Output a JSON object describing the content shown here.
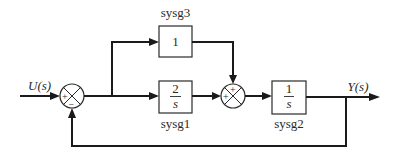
{
  "diagram": {
    "type": "block-diagram",
    "input": {
      "label": "U(s)"
    },
    "output": {
      "label": "Y(s)"
    },
    "summing_junctions": [
      {
        "id": "sum1",
        "signs": {
          "left": "+",
          "bottom": "−"
        }
      },
      {
        "id": "sum2",
        "signs": {
          "left": "+",
          "top": "+"
        }
      }
    ],
    "blocks": [
      {
        "id": "sysg3",
        "name": "sysg3",
        "tf_num": "1",
        "tf_den": "",
        "position": "top-branch"
      },
      {
        "id": "sysg1",
        "name": "sysg1",
        "tf_num": "2",
        "tf_den": "s",
        "position": "bottom-branch"
      },
      {
        "id": "sysg2",
        "name": "sysg2",
        "tf_num": "1",
        "tf_den": "s",
        "position": "forward"
      }
    ],
    "connections": [
      "U(s) → sum1 (+)",
      "sum1 → branch point",
      "branch point → sysg3",
      "branch point → sysg1",
      "sysg3 → sum2 (+, top)",
      "sysg1 → sum2 (+, left)",
      "sum2 → sysg2",
      "sysg2 → Y(s)",
      "Y(s) → feedback → sum1 (−, bottom)"
    ],
    "colors": {
      "line": "#1a1a1a",
      "background": "#ffffff"
    }
  }
}
